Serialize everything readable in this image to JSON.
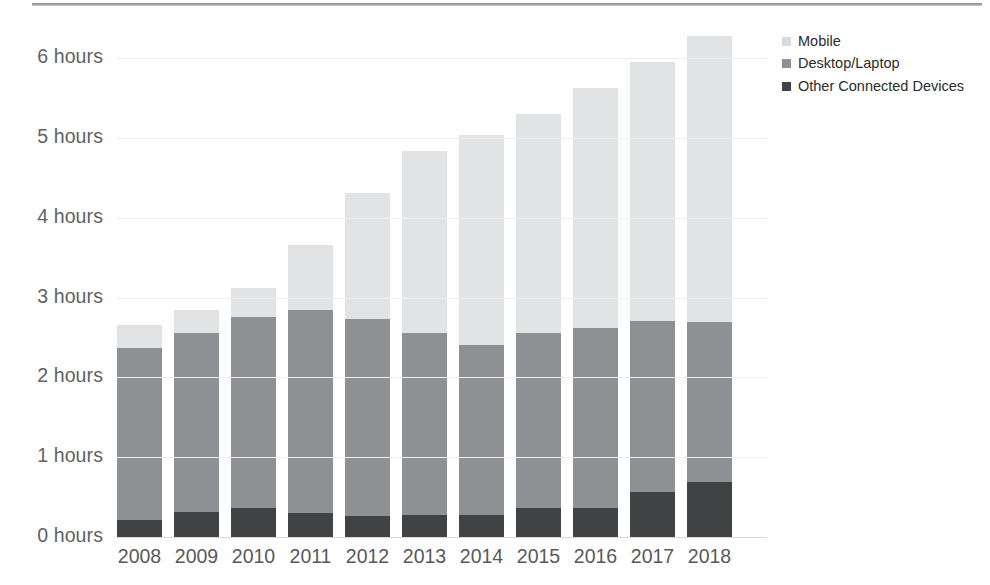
{
  "chart_data": {
    "type": "bar",
    "subtype": "stacked-vertical",
    "title": "",
    "xlabel": "",
    "ylabel": "",
    "ylim": [
      0,
      6.4
    ],
    "y_ticks": [
      0,
      1,
      2,
      3,
      4,
      5,
      6
    ],
    "y_tick_labels": [
      "0 hours",
      "1 hours",
      "2 hours",
      "3 hours",
      "4 hours",
      "5 hours",
      "6 hours"
    ],
    "y_unit": "hours",
    "grid": true,
    "legend_position": "right-top",
    "categories": [
      "2008",
      "2009",
      "2010",
      "2011",
      "2012",
      "2013",
      "2014",
      "2015",
      "2016",
      "2017",
      "2018"
    ],
    "series": [
      {
        "name": "Other Connected Devices",
        "color": "#414244",
        "values": [
          0.21,
          0.31,
          0.36,
          0.3,
          0.26,
          0.27,
          0.27,
          0.36,
          0.36,
          0.56,
          0.69
        ]
      },
      {
        "name": "Desktop/Laptop",
        "color": "#8e9093",
        "values": [
          2.16,
          2.24,
          2.4,
          2.55,
          2.47,
          2.28,
          2.14,
          2.2,
          2.26,
          2.15,
          2.0
        ]
      },
      {
        "name": "Mobile",
        "color": "#e2e3e4",
        "values": [
          0.29,
          0.29,
          0.36,
          0.81,
          1.58,
          2.29,
          2.63,
          2.74,
          3.0,
          3.24,
          3.59
        ]
      }
    ],
    "totals": [
      2.66,
      2.84,
      3.12,
      3.66,
      4.31,
      4.84,
      5.04,
      5.3,
      5.62,
      5.95,
      6.28
    ]
  },
  "legend": {
    "items": [
      {
        "label": "Mobile",
        "color": "#d8d9da"
      },
      {
        "label": "Desktop/Laptop",
        "color": "#8e9093"
      },
      {
        "label": "Other Connected Devices",
        "color": "#414244"
      }
    ]
  },
  "colors": {
    "mobile": "#e2e3e4",
    "desktop": "#8e9093",
    "other": "#414244",
    "axis_text": "#58595b",
    "gridline": "#efeff0",
    "top_rule": "#8d8f91"
  }
}
